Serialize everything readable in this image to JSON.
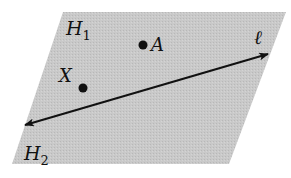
{
  "diagram": {
    "plane": {
      "fill": "#c6c6c6",
      "corners": [
        [
          63,
          12
        ],
        [
          286,
          12
        ],
        [
          229,
          164
        ],
        [
          12,
          164
        ]
      ]
    },
    "halfplane_labels": [
      {
        "name": "H",
        "subscript": "1",
        "x": 66,
        "y": 35
      },
      {
        "name": "H",
        "subscript": "2",
        "x": 24,
        "y": 160
      }
    ],
    "line": {
      "label": "ℓ",
      "label_x": 254,
      "label_y": 44,
      "from": [
        25,
        125
      ],
      "to": [
        268,
        54
      ],
      "color": "#111111"
    },
    "points": [
      {
        "label": "A",
        "cx": 143,
        "cy": 45,
        "label_x": 151,
        "label_y": 51
      },
      {
        "label": "X",
        "cx": 83,
        "cy": 88,
        "label_x": 59,
        "label_y": 82
      }
    ]
  }
}
